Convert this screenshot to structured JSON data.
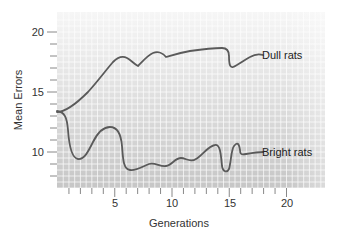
{
  "chart_data": {
    "type": "line",
    "title": "",
    "xlabel": "Generations",
    "ylabel": "Mean Errors",
    "xlim": [
      0,
      23
    ],
    "ylim": [
      6.5,
      21.3
    ],
    "x_ticks_major": [
      5,
      10,
      15,
      20
    ],
    "x_ticks_minor": [
      1,
      2,
      3,
      4,
      6,
      7,
      8,
      9,
      11,
      12,
      13,
      14,
      16,
      17,
      18,
      19
    ],
    "y_ticks_major": [
      10,
      15,
      20
    ],
    "y_ticks_minor": [
      8,
      9,
      11,
      12,
      13,
      14,
      16,
      17,
      18,
      19
    ],
    "grid": true,
    "legend": "inline labels at right end of each line",
    "series": [
      {
        "name": "Dull rats",
        "x": [
          0,
          1,
          2,
          3,
          4,
          5,
          6,
          7,
          8,
          9,
          10,
          11,
          12,
          13,
          13.5,
          14,
          15,
          16,
          17
        ],
        "values": [
          13.2,
          13.5,
          14.5,
          15.8,
          17.0,
          17.8,
          17.3,
          18.2,
          18.5,
          17.9,
          18.0,
          18.2,
          18.3,
          18.4,
          18.0,
          17.0,
          17.6,
          18.2,
          18.2
        ]
      },
      {
        "name": "Bright rats",
        "x": [
          0,
          1,
          2,
          3,
          4,
          5,
          6,
          7,
          8,
          9,
          10,
          11,
          12,
          13,
          13.5,
          14,
          15,
          15.5,
          16,
          17
        ],
        "values": [
          13.2,
          9.5,
          9.6,
          11.0,
          12.2,
          11.3,
          8.7,
          8.7,
          9.0,
          8.8,
          9.4,
          9.2,
          9.7,
          10.5,
          9.0,
          8.8,
          10.8,
          10.0,
          10.0,
          10.0
        ]
      }
    ]
  },
  "labels": {
    "dull": "Dull rats",
    "bright": "Bright rats",
    "xlabel": "Generations",
    "ylabel": "Mean Errors",
    "y20": "20",
    "y15": "15",
    "y10": "10",
    "x5": "5",
    "x10": "10",
    "x15": "15",
    "x20": "20"
  },
  "colors": {
    "plot_bg_top": "#f4f4f4",
    "plot_bg_bottom": "#c9c9c9",
    "grid": "#ffffff",
    "line": "#5a5a5a",
    "axis": "#777777",
    "text": "#333333"
  }
}
